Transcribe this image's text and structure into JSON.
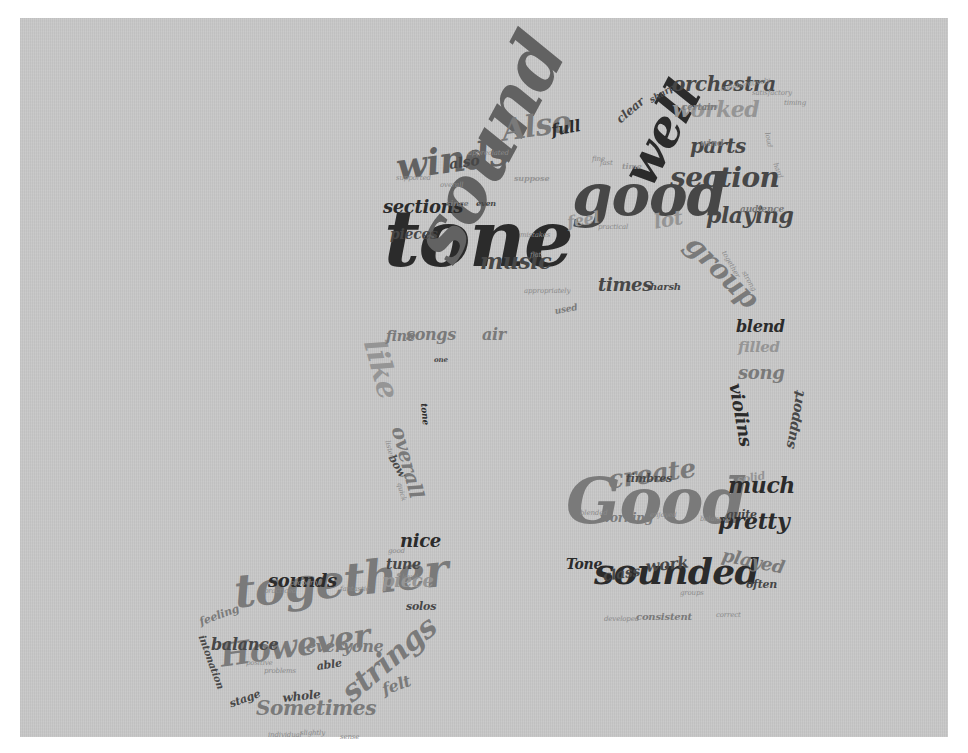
{
  "image": {
    "description": "Word cloud in the shape of a musical note (beamed eighth notes)",
    "shape": "music-note"
  },
  "colors": {
    "background": "#ffffff",
    "panel": "#c8c8c8",
    "text_darkest": "#2b2b2b",
    "text_dark": "#474747",
    "text_mid": "#626262",
    "text_light": "#7a7a7a",
    "text_lightest": "#959595"
  },
  "words": [
    {
      "text": "tone",
      "size": 78,
      "x": 384,
      "y": 262,
      "rot": 0,
      "shade": "c1"
    },
    {
      "text": "sound",
      "size": 74,
      "x": 398,
      "y": 296,
      "rot": -62,
      "shade": "c3"
    },
    {
      "text": "good",
      "size": 58,
      "x": 572,
      "y": 212,
      "rot": 0,
      "shade": "c2"
    },
    {
      "text": "Good",
      "size": 64,
      "x": 566,
      "y": 520,
      "rot": 0,
      "shade": "c4"
    },
    {
      "text": "well",
      "size": 50,
      "x": 614,
      "y": 210,
      "rot": -62,
      "shade": "c1"
    },
    {
      "text": "together",
      "size": 46,
      "x": 232,
      "y": 606,
      "rot": -6,
      "shade": "c4"
    },
    {
      "text": "sounded",
      "size": 36,
      "x": 594,
      "y": 582,
      "rot": 0,
      "shade": "c1"
    },
    {
      "text": "winds",
      "size": 36,
      "x": 394,
      "y": 178,
      "rot": -8,
      "shade": "c3"
    },
    {
      "text": "However",
      "size": 32,
      "x": 218,
      "y": 666,
      "rot": -8,
      "shade": "c4"
    },
    {
      "text": "strings",
      "size": 30,
      "x": 336,
      "y": 708,
      "rot": -40,
      "shade": "c4"
    },
    {
      "text": "Also",
      "size": 30,
      "x": 500,
      "y": 140,
      "rot": -8,
      "shade": "c4"
    },
    {
      "text": "section",
      "size": 28,
      "x": 670,
      "y": 186,
      "rot": 0,
      "shade": "c2"
    },
    {
      "text": "group",
      "size": 28,
      "x": 700,
      "y": 252,
      "rot": 45,
      "shade": "c4"
    },
    {
      "text": "create",
      "size": 26,
      "x": 606,
      "y": 488,
      "rot": -8,
      "shade": "c4"
    },
    {
      "text": "like",
      "size": 30,
      "x": 388,
      "y": 360,
      "rot": 75,
      "shade": "c5"
    },
    {
      "text": "overall",
      "size": 20,
      "x": 408,
      "y": 440,
      "rot": 75,
      "shade": "c4"
    },
    {
      "text": "orchestra",
      "size": 20,
      "x": 672,
      "y": 90,
      "rot": 0,
      "shade": "c2"
    },
    {
      "text": "worked",
      "size": 22,
      "x": 672,
      "y": 116,
      "rot": 0,
      "shade": "c5"
    },
    {
      "text": "parts",
      "size": 20,
      "x": 690,
      "y": 152,
      "rot": 0,
      "shade": "c2"
    },
    {
      "text": "playing",
      "size": 22,
      "x": 706,
      "y": 222,
      "rot": 0,
      "shade": "c2"
    },
    {
      "text": "music",
      "size": 22,
      "x": 480,
      "y": 268,
      "rot": 0,
      "shade": "c2"
    },
    {
      "text": "sections",
      "size": 18,
      "x": 383,
      "y": 212,
      "rot": 0,
      "shade": "c1"
    },
    {
      "text": "pieces",
      "size": 14,
      "x": 390,
      "y": 238,
      "rot": 0,
      "shade": "c2"
    },
    {
      "text": "times",
      "size": 18,
      "x": 598,
      "y": 290,
      "rot": 0,
      "shade": "c2"
    },
    {
      "text": "lot",
      "size": 20,
      "x": 652,
      "y": 228,
      "rot": -10,
      "shade": "c5"
    },
    {
      "text": "feel",
      "size": 16,
      "x": 566,
      "y": 228,
      "rot": -10,
      "shade": "c5"
    },
    {
      "text": "full",
      "size": 16,
      "x": 550,
      "y": 136,
      "rot": -10,
      "shade": "c1"
    },
    {
      "text": "also",
      "size": 14,
      "x": 448,
      "y": 168,
      "rot": -8,
      "shade": "c2"
    },
    {
      "text": "clear",
      "size": 12,
      "x": 614,
      "y": 126,
      "rot": -40,
      "shade": "c2"
    },
    {
      "text": "sharp",
      "size": 9,
      "x": 648,
      "y": 104,
      "rot": -30,
      "shade": "c2"
    },
    {
      "text": "blend",
      "size": 16,
      "x": 736,
      "y": 332,
      "rot": 0,
      "shade": "c1"
    },
    {
      "text": "filled",
      "size": 15,
      "x": 738,
      "y": 352,
      "rot": 0,
      "shade": "c5"
    },
    {
      "text": "song",
      "size": 18,
      "x": 738,
      "y": 378,
      "rot": 0,
      "shade": "c4"
    },
    {
      "text": "violins",
      "size": 18,
      "x": 744,
      "y": 396,
      "rot": 80,
      "shade": "c1"
    },
    {
      "text": "support",
      "size": 14,
      "x": 782,
      "y": 458,
      "rot": -80,
      "shade": "c2"
    },
    {
      "text": "solid",
      "size": 11,
      "x": 736,
      "y": 484,
      "rot": -10,
      "shade": "c5"
    },
    {
      "text": "much",
      "size": 22,
      "x": 728,
      "y": 492,
      "rot": 0,
      "shade": "c1"
    },
    {
      "text": "quite",
      "size": 11,
      "x": 726,
      "y": 518,
      "rot": 0,
      "shade": "c2"
    },
    {
      "text": "pretty",
      "size": 22,
      "x": 718,
      "y": 528,
      "rot": 0,
      "shade": "c1"
    },
    {
      "text": "played",
      "size": 18,
      "x": 724,
      "y": 560,
      "rot": 12,
      "shade": "c4"
    },
    {
      "text": "often",
      "size": 11,
      "x": 746,
      "y": 588,
      "rot": 0,
      "shade": "c2"
    },
    {
      "text": "working",
      "size": 12,
      "x": 600,
      "y": 522,
      "rot": 0,
      "shade": "c4"
    },
    {
      "text": "timbres",
      "size": 11,
      "x": 626,
      "y": 482,
      "rot": 0,
      "shade": "c2"
    },
    {
      "text": "work",
      "size": 16,
      "x": 645,
      "y": 572,
      "rot": -6,
      "shade": "c2"
    },
    {
      "text": "class",
      "size": 14,
      "x": 602,
      "y": 580,
      "rot": -8,
      "shade": "c2"
    },
    {
      "text": "Tone",
      "size": 14,
      "x": 566,
      "y": 568,
      "rot": 0,
      "shade": "c1"
    },
    {
      "text": "consistent",
      "size": 10,
      "x": 636,
      "y": 620,
      "rot": 0,
      "shade": "c4"
    },
    {
      "text": "songs",
      "size": 16,
      "x": 406,
      "y": 340,
      "rot": 0,
      "shade": "c4"
    },
    {
      "text": "fine",
      "size": 14,
      "x": 386,
      "y": 340,
      "rot": 0,
      "shade": "c4"
    },
    {
      "text": "air",
      "size": 16,
      "x": 482,
      "y": 340,
      "rot": 0,
      "shade": "c4"
    },
    {
      "text": "one",
      "size": 7,
      "x": 434,
      "y": 362,
      "rot": 0,
      "shade": "c2"
    },
    {
      "text": "tone",
      "size": 9,
      "x": 428,
      "y": 410,
      "rot": 85,
      "shade": "c1"
    },
    {
      "text": "bow",
      "size": 11,
      "x": 396,
      "y": 462,
      "rot": 60,
      "shade": "c2"
    },
    {
      "text": "nice",
      "size": 18,
      "x": 400,
      "y": 546,
      "rot": 0,
      "shade": "c1"
    },
    {
      "text": "tune",
      "size": 14,
      "x": 386,
      "y": 568,
      "rot": 0,
      "shade": "c2"
    },
    {
      "text": "piece",
      "size": 18,
      "x": 382,
      "y": 586,
      "rot": 0,
      "shade": "c5"
    },
    {
      "text": "solos",
      "size": 11,
      "x": 406,
      "y": 610,
      "rot": 0,
      "shade": "c2"
    },
    {
      "text": "sounds",
      "size": 18,
      "x": 268,
      "y": 586,
      "rot": 0,
      "shade": "c1"
    },
    {
      "text": "balance",
      "size": 16,
      "x": 211,
      "y": 650,
      "rot": 0,
      "shade": "c2"
    },
    {
      "text": "everyone",
      "size": 16,
      "x": 306,
      "y": 652,
      "rot": 0,
      "shade": "c4"
    },
    {
      "text": "able",
      "size": 11,
      "x": 316,
      "y": 670,
      "rot": -8,
      "shade": "c2"
    },
    {
      "text": "felt",
      "size": 16,
      "x": 380,
      "y": 696,
      "rot": -20,
      "shade": "c4"
    },
    {
      "text": "whole",
      "size": 12,
      "x": 282,
      "y": 702,
      "rot": -6,
      "shade": "c2"
    },
    {
      "text": "Sometimes",
      "size": 20,
      "x": 256,
      "y": 714,
      "rot": 0,
      "shade": "c4"
    },
    {
      "text": "stage",
      "size": 11,
      "x": 228,
      "y": 708,
      "rot": -20,
      "shade": "c2"
    },
    {
      "text": "feeling",
      "size": 11,
      "x": 198,
      "y": 626,
      "rot": -20,
      "shade": "c4"
    },
    {
      "text": "intonation",
      "size": 10,
      "x": 206,
      "y": 642,
      "rot": 70,
      "shade": "c2"
    },
    {
      "text": "since",
      "size": 8,
      "x": 446,
      "y": 205,
      "rot": 0,
      "shade": "c4"
    },
    {
      "text": "even",
      "size": 8,
      "x": 476,
      "y": 205,
      "rot": 0,
      "shade": "c2"
    },
    {
      "text": "suppose",
      "size": 8,
      "x": 514,
      "y": 180,
      "rot": 0,
      "shade": "c5"
    },
    {
      "text": "certain",
      "size": 9,
      "x": 682,
      "y": 110,
      "rot": 0,
      "shade": "c4"
    },
    {
      "text": "wind",
      "size": 9,
      "x": 700,
      "y": 146,
      "rot": 0,
      "shade": "c4"
    },
    {
      "text": "audience",
      "size": 9,
      "x": 740,
      "y": 212,
      "rot": 0,
      "shade": "c4"
    },
    {
      "text": "harsh",
      "size": 10,
      "x": 650,
      "y": 290,
      "rot": 0,
      "shade": "c2"
    },
    {
      "text": "used",
      "size": 9,
      "x": 554,
      "y": 314,
      "rot": -10,
      "shade": "c4"
    },
    {
      "text": "time",
      "size": 8,
      "x": 622,
      "y": 168,
      "rot": 0,
      "shade": "c5"
    }
  ],
  "tiny_words": [
    {
      "text": "collaboratively",
      "x": 720,
      "y": 86,
      "rot": -10
    },
    {
      "text": "satisfactory",
      "x": 752,
      "y": 90,
      "rot": 0
    },
    {
      "text": "timing",
      "x": 784,
      "y": 100,
      "rot": 0
    },
    {
      "text": "loud",
      "x": 770,
      "y": 132,
      "rot": 80
    },
    {
      "text": "hard",
      "x": 778,
      "y": 162,
      "rot": 70
    },
    {
      "text": "appreciated",
      "x": 468,
      "y": 150,
      "rot": 0
    },
    {
      "text": "supported",
      "x": 396,
      "y": 175,
      "rot": 0
    },
    {
      "text": "overall",
      "x": 440,
      "y": 182,
      "rot": 0
    },
    {
      "text": "fine",
      "x": 592,
      "y": 156,
      "rot": 0
    },
    {
      "text": "fast",
      "x": 600,
      "y": 160,
      "rot": 0
    },
    {
      "text": "practical",
      "x": 598,
      "y": 224,
      "rot": 0
    },
    {
      "text": "mistakes",
      "x": 520,
      "y": 232,
      "rot": 0
    },
    {
      "text": "flat",
      "x": 530,
      "y": 252,
      "rot": 0
    },
    {
      "text": "appropriately",
      "x": 524,
      "y": 288,
      "rot": 0
    },
    {
      "text": "together",
      "x": 726,
      "y": 250,
      "rot": 60
    },
    {
      "text": "strong",
      "x": 746,
      "y": 270,
      "rot": 60
    },
    {
      "text": "enjoyed",
      "x": 650,
      "y": 512,
      "rot": 0
    },
    {
      "text": "balanced",
      "x": 700,
      "y": 516,
      "rot": 0
    },
    {
      "text": "blended",
      "x": 580,
      "y": 510,
      "rot": 0
    },
    {
      "text": "groups",
      "x": 680,
      "y": 590,
      "rot": 0
    },
    {
      "text": "developed",
      "x": 604,
      "y": 616,
      "rot": 0
    },
    {
      "text": "correct",
      "x": 716,
      "y": 612,
      "rot": 0
    },
    {
      "text": "properly",
      "x": 290,
      "y": 580,
      "rot": 0
    },
    {
      "text": "practiced",
      "x": 264,
      "y": 588,
      "rot": 0
    },
    {
      "text": "fantastic",
      "x": 340,
      "y": 586,
      "rot": 0
    },
    {
      "text": "positive",
      "x": 246,
      "y": 660,
      "rot": 0
    },
    {
      "text": "problems",
      "x": 264,
      "y": 668,
      "rot": 0
    },
    {
      "text": "individual",
      "x": 268,
      "y": 732,
      "rot": 0
    },
    {
      "text": "slightly",
      "x": 300,
      "y": 730,
      "rot": 0
    },
    {
      "text": "sense",
      "x": 340,
      "y": 734,
      "rot": 0
    },
    {
      "text": "level",
      "x": 402,
      "y": 574,
      "rot": 0
    },
    {
      "text": "good",
      "x": 388,
      "y": 548,
      "rot": 0
    },
    {
      "text": "quick",
      "x": 402,
      "y": 482,
      "rot": 75
    },
    {
      "text": "listen",
      "x": 390,
      "y": 440,
      "rot": 75
    }
  ]
}
